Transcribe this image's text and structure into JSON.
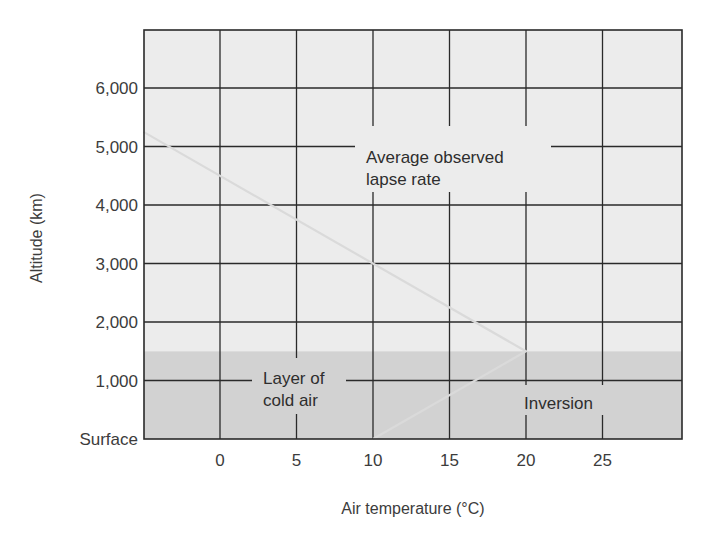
{
  "chart_data": {
    "type": "line",
    "title": "",
    "xlabel": "Air temperature (°C)",
    "ylabel": "Altitude (km)",
    "xlim": [
      -5,
      30
    ],
    "ylim": [
      0,
      7000
    ],
    "x_ticks": [
      0,
      5,
      10,
      15,
      20,
      25
    ],
    "x_tick_labels": [
      "0",
      "5",
      "10",
      "15",
      "20",
      "25"
    ],
    "y_ticks": [
      0,
      1000,
      2000,
      3000,
      4000,
      5000,
      6000
    ],
    "y_tick_labels": [
      "Surface",
      "1,000",
      "2,000",
      "3,000",
      "4,000",
      "5,000",
      "6,000"
    ],
    "grid": true,
    "series": [
      {
        "name": "Temperature profile",
        "color": "#d8d8d8",
        "points": [
          {
            "x": 10,
            "y": 0
          },
          {
            "x": 20,
            "y": 1500
          },
          {
            "x": -5,
            "y": 5250
          }
        ]
      }
    ],
    "regions": [
      {
        "name": "Layer of cold air (inversion layer)",
        "y_from": 0,
        "y_to": 1500,
        "color": "#d2d2d2"
      },
      {
        "name": "Upper atmosphere",
        "y_from": 1500,
        "y_to": 7000,
        "color": "#ececec"
      }
    ],
    "annotations": [
      {
        "text": "Average observed lapse rate",
        "lines": [
          "Average observed",
          "lapse rate"
        ],
        "x": 10.5,
        "y": 4700
      },
      {
        "text": "Layer of cold air",
        "lines": [
          "Layer of",
          "cold air"
        ],
        "x": 3,
        "y": 900
      },
      {
        "text": "Inversion",
        "lines": [
          "Inversion"
        ],
        "x": 20,
        "y": 600
      }
    ],
    "colors": {
      "upper_band": "#ececec",
      "inversion_band": "#d2d2d2",
      "grid": "#2a2a2a",
      "line": "#dadada"
    }
  }
}
